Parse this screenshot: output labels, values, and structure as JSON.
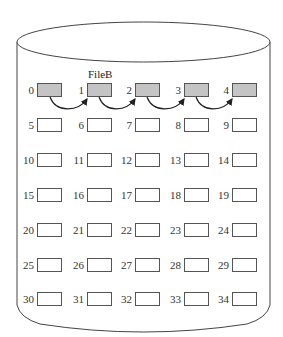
{
  "diagram": {
    "type": "disk-linked-allocation",
    "file": {
      "label": "FileB",
      "blocks": [
        0,
        1,
        2,
        3,
        4
      ],
      "links": [
        [
          0,
          1
        ],
        [
          1,
          2
        ],
        [
          2,
          3
        ],
        [
          3,
          4
        ]
      ]
    },
    "grid": {
      "rows": 7,
      "cols": 5
    },
    "blocks": [
      {
        "n": "0",
        "used": true
      },
      {
        "n": "1",
        "used": true
      },
      {
        "n": "2",
        "used": true
      },
      {
        "n": "3",
        "used": true
      },
      {
        "n": "4",
        "used": true
      },
      {
        "n": "5",
        "used": false
      },
      {
        "n": "6",
        "used": false
      },
      {
        "n": "7",
        "used": false
      },
      {
        "n": "8",
        "used": false
      },
      {
        "n": "9",
        "used": false
      },
      {
        "n": "10",
        "used": false
      },
      {
        "n": "11",
        "used": false
      },
      {
        "n": "12",
        "used": false
      },
      {
        "n": "13",
        "used": false
      },
      {
        "n": "14",
        "used": false
      },
      {
        "n": "15",
        "used": false
      },
      {
        "n": "16",
        "used": false
      },
      {
        "n": "17",
        "used": false
      },
      {
        "n": "18",
        "used": false
      },
      {
        "n": "19",
        "used": false
      },
      {
        "n": "20",
        "used": false
      },
      {
        "n": "21",
        "used": false
      },
      {
        "n": "22",
        "used": false
      },
      {
        "n": "23",
        "used": false
      },
      {
        "n": "24",
        "used": false
      },
      {
        "n": "25",
        "used": false
      },
      {
        "n": "26",
        "used": false
      },
      {
        "n": "27",
        "used": false
      },
      {
        "n": "28",
        "used": false
      },
      {
        "n": "29",
        "used": false
      },
      {
        "n": "30",
        "used": false
      },
      {
        "n": "31",
        "used": false
      },
      {
        "n": "32",
        "used": false
      },
      {
        "n": "33",
        "used": false
      },
      {
        "n": "34",
        "used": false
      }
    ],
    "colors": {
      "used_fill": "#c4c4c4",
      "free_fill": "#ffffff",
      "stroke": "#555555"
    }
  }
}
